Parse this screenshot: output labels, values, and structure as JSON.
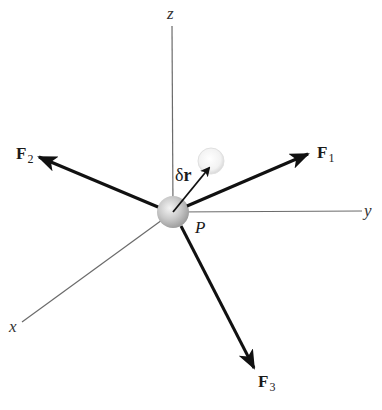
{
  "diagram": {
    "axes": {
      "x": {
        "label": "x"
      },
      "y": {
        "label": "y"
      },
      "z": {
        "label": "z"
      }
    },
    "point": {
      "label": "P"
    },
    "virtual_displacement": {
      "symbol": "δ",
      "vector": "r"
    },
    "forces": [
      {
        "name": "F",
        "index": "1"
      },
      {
        "name": "F",
        "index": "2"
      },
      {
        "name": "F",
        "index": "3"
      }
    ],
    "colors": {
      "axis_line": "#6b6b6b",
      "force_arrow": "#111111",
      "particle": "#bdbdbd",
      "ghost_particle": "#e4e4e4"
    }
  }
}
